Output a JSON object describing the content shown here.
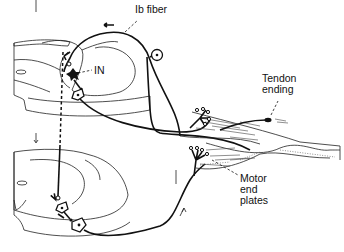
{
  "figure": {
    "labels": {
      "ib_fiber": "Ib fiber",
      "interneuron": "IN",
      "tendon_ending_line1": "Tendon",
      "tendon_ending_line2": "ending",
      "motor_end_plates_line1": "Motor",
      "motor_end_plates_line2": "end",
      "motor_end_plates_line3": "plates"
    },
    "components": [
      "upper spinal cord segment",
      "lower spinal cord segment",
      "Ib afferent fiber with dorsal root ganglion",
      "inhibitory interneuron (IN)",
      "motor neurons",
      "upper muscle with motor end plates",
      "lower muscle with motor end plates",
      "tendon ending (Golgi tendon organ)"
    ],
    "colors": {
      "line": "#111111",
      "background": "#ffffff"
    }
  }
}
